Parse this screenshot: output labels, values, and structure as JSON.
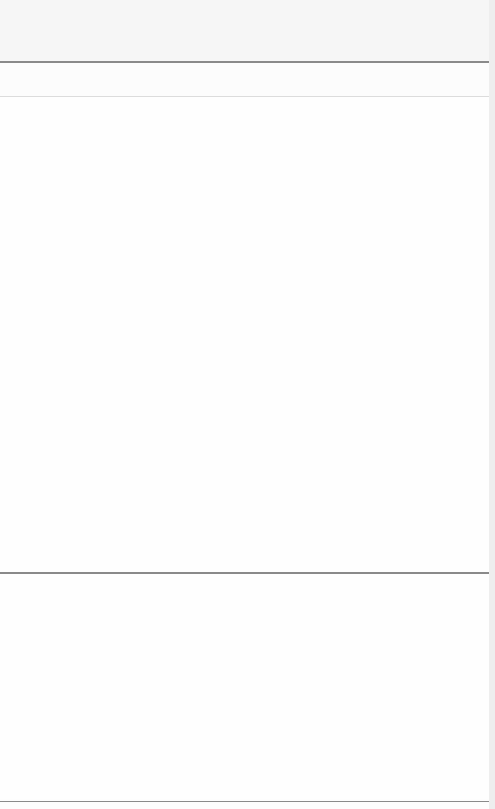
{
  "window": {
    "title": ""
  },
  "header": {
    "title": ""
  },
  "content": {
    "upper_panel_text": "",
    "lower_panel_text": ""
  },
  "colors": {
    "divider": "#8a8a8a",
    "background": "#fdfdfd",
    "topbar": "#f6f6f6"
  }
}
